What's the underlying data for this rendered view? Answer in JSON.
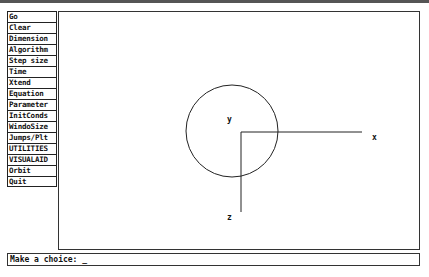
{
  "menu": {
    "items": [
      {
        "label": "Go"
      },
      {
        "label": "Clear"
      },
      {
        "label": "Dimension"
      },
      {
        "label": "Algorithm"
      },
      {
        "label": "Step size"
      },
      {
        "label": "Time"
      },
      {
        "label": "Xtend"
      },
      {
        "label": "Equation"
      },
      {
        "label": "Parameter"
      },
      {
        "label": "InitConds"
      },
      {
        "label": "WindoSize"
      },
      {
        "label": "Jumps/Plt"
      },
      {
        "label": "UTILITIES"
      },
      {
        "label": "VISUALAID"
      },
      {
        "label": "Orbit"
      },
      {
        "label": "Quit"
      }
    ]
  },
  "plot": {
    "axes": {
      "x": "x",
      "y": "y",
      "z": "z"
    },
    "circle": {
      "cx": 173,
      "cy": 119,
      "r": 46
    }
  },
  "prompt": {
    "text": "Make a choice: _"
  }
}
